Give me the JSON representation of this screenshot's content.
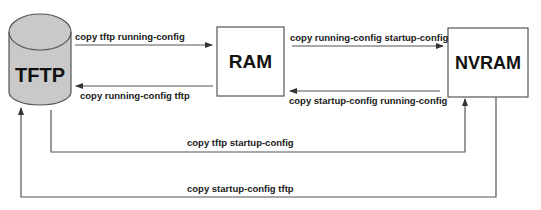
{
  "diagram": {
    "nodes": {
      "tftp": {
        "label": "TFTP",
        "shape": "cylinder",
        "fill": "#c9c9c9"
      },
      "ram": {
        "label": "RAM",
        "shape": "box",
        "fill": "#ffffff"
      },
      "nvram": {
        "label": "NVRAM",
        "shape": "box",
        "fill": "#ffffff"
      }
    },
    "edges": [
      {
        "id": "tftp-to-ram",
        "from": "TFTP",
        "to": "RAM",
        "label": "copy tftp running-config"
      },
      {
        "id": "ram-to-tftp",
        "from": "RAM",
        "to": "TFTP",
        "label": "copy running-config tftp"
      },
      {
        "id": "ram-to-nvram",
        "from": "RAM",
        "to": "NVRAM",
        "label": "copy running-config startup-config"
      },
      {
        "id": "nvram-to-ram",
        "from": "NVRAM",
        "to": "RAM",
        "label": "copy startup-config running-config"
      },
      {
        "id": "tftp-to-nvram",
        "from": "TFTP",
        "to": "NVRAM",
        "label": "copy tftp startup-config"
      },
      {
        "id": "nvram-to-tftp",
        "from": "NVRAM",
        "to": "TFTP",
        "label": "copy startup-config tftp"
      }
    ],
    "line_color": "#555555",
    "text_color": "#111111"
  }
}
